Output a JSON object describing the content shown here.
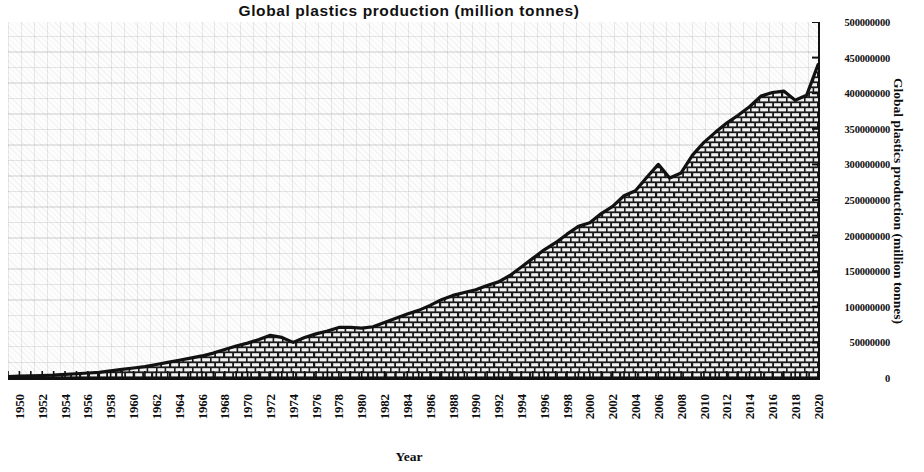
{
  "chart_data": {
    "type": "area",
    "title": "Global  plastics  production  (million  tonnes)",
    "xlabel": "Year",
    "ylabel": "Global  plastics production (million tonnes)",
    "xlim": [
      1950,
      2021
    ],
    "ylim": [
      0,
      500000000
    ],
    "grid": true,
    "legend": null,
    "y_ticks": [
      0,
      50000000,
      100000000,
      150000000,
      200000000,
      250000000,
      300000000,
      350000000,
      400000000,
      450000000,
      500000000
    ],
    "y_tick_labels": [
      "0",
      "50000000",
      "100000000",
      "150000000",
      "200000000",
      "250000000",
      "300000000",
      "350000000",
      "400000000",
      "450000000",
      "500000000"
    ],
    "x_tick_labels": [
      "1950",
      "1952",
      "1954",
      "1956",
      "1958",
      "1960",
      "1962",
      "1964",
      "1966",
      "1968",
      "1970",
      "1972",
      "1974",
      "1976",
      "1978",
      "1980",
      "1982",
      "1984",
      "1986",
      "1988",
      "1990",
      "1992",
      "1994",
      "1996",
      "1998",
      "2000",
      "2002",
      "2004",
      "2006",
      "2008",
      "2010",
      "2012",
      "2014",
      "2016",
      "2018",
      "2020"
    ],
    "series_name": "Global plastics production",
    "fill_pattern": "brick-hatch",
    "line_color": "#111111",
    "x": [
      1950,
      1951,
      1952,
      1953,
      1954,
      1955,
      1956,
      1957,
      1958,
      1959,
      1960,
      1961,
      1962,
      1963,
      1964,
      1965,
      1966,
      1967,
      1968,
      1969,
      1970,
      1971,
      1972,
      1973,
      1974,
      1975,
      1976,
      1977,
      1978,
      1979,
      1980,
      1981,
      1982,
      1983,
      1984,
      1985,
      1986,
      1987,
      1988,
      1989,
      1990,
      1991,
      1992,
      1993,
      1994,
      1995,
      1996,
      1997,
      1998,
      1999,
      2000,
      2001,
      2002,
      2003,
      2004,
      2005,
      2006,
      2007,
      2008,
      2009,
      2010,
      2011,
      2012,
      2013,
      2014,
      2015,
      2016,
      2017,
      2018,
      2019,
      2020,
      2021
    ],
    "y": [
      2000000,
      2500000,
      3000000,
      3500000,
      4000000,
      5000000,
      6000000,
      7000000,
      8000000,
      10000000,
      12000000,
      14000000,
      16000000,
      19000000,
      22000000,
      25000000,
      28000000,
      31000000,
      35000000,
      40000000,
      45000000,
      49000000,
      54000000,
      60000000,
      57000000,
      50000000,
      57000000,
      62000000,
      66000000,
      71000000,
      71000000,
      70000000,
      72000000,
      78000000,
      84000000,
      90000000,
      95000000,
      102000000,
      110000000,
      116000000,
      120000000,
      124000000,
      130000000,
      135000000,
      144000000,
      156000000,
      168000000,
      180000000,
      190000000,
      202000000,
      213000000,
      218000000,
      231000000,
      241000000,
      256000000,
      263000000,
      282000000,
      300000000,
      281000000,
      288000000,
      313000000,
      331000000,
      345000000,
      358000000,
      369000000,
      381000000,
      396000000,
      401000000,
      403000000,
      390000000,
      397000000,
      440000000
    ]
  }
}
